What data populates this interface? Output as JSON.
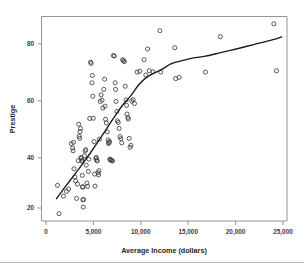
{
  "chart_data": {
    "type": "scatter",
    "title": "",
    "xlabel": "Average Income (dollars)",
    "ylabel": "Prestige",
    "xlim": [
      -1200,
      26800
    ],
    "ylim": [
      12,
      90
    ],
    "grid": false,
    "legend": null,
    "xticks": [
      0,
      5000,
      10000,
      15000,
      20000,
      25000
    ],
    "xtick_labels": [
      "0",
      "5,000",
      "10,000",
      "15,000",
      "20,000",
      "25,000"
    ],
    "yticks": [
      20,
      40,
      60,
      80
    ],
    "ytick_labels": [
      "20",
      "40",
      "60",
      "80"
    ],
    "marker": "open-circle",
    "marker_color": "#3c3c3c",
    "points": [
      [
        625,
        25.6
      ],
      [
        800,
        14.8
      ],
      [
        1300,
        21.5
      ],
      [
        1650,
        23.3
      ],
      [
        1890,
        24.2
      ],
      [
        2200,
        41.5
      ],
      [
        2350,
        39.8
      ],
      [
        2400,
        38.8
      ],
      [
        2450,
        42.0
      ],
      [
        2500,
        31.9
      ],
      [
        2600,
        28.8
      ],
      [
        2700,
        27.3
      ],
      [
        2800,
        20.6
      ],
      [
        2900,
        26.1
      ],
      [
        3000,
        35.0
      ],
      [
        3050,
        48.9
      ],
      [
        3100,
        44.3
      ],
      [
        3150,
        43.5
      ],
      [
        3200,
        46.1
      ],
      [
        3250,
        47.3
      ],
      [
        3300,
        36.2
      ],
      [
        3350,
        35.9
      ],
      [
        3400,
        34.8
      ],
      [
        3430,
        35.2
      ],
      [
        3450,
        29.4
      ],
      [
        3480,
        25.1
      ],
      [
        3500,
        24.9
      ],
      [
        3520,
        20.1
      ],
      [
        3560,
        17.3
      ],
      [
        3600,
        20.2
      ],
      [
        3700,
        36.9
      ],
      [
        3780,
        38.7
      ],
      [
        3850,
        39.2
      ],
      [
        3900,
        33.3
      ],
      [
        3980,
        26.5
      ],
      [
        4050,
        25.2
      ],
      [
        4150,
        30.9
      ],
      [
        4200,
        35.6
      ],
      [
        4300,
        51.1
      ],
      [
        4400,
        72.6
      ],
      [
        4460,
        72.1
      ],
      [
        4550,
        64.7
      ],
      [
        4600,
        67.5
      ],
      [
        4650,
        59.6
      ],
      [
        4700,
        51.2
      ],
      [
        4800,
        42.3
      ],
      [
        4850,
        29.9
      ],
      [
        4900,
        25.3
      ],
      [
        5000,
        35.9
      ],
      [
        5050,
        36.2
      ],
      [
        5100,
        35.2
      ],
      [
        5150,
        34.9
      ],
      [
        5250,
        30.4
      ],
      [
        5300,
        29.6
      ],
      [
        5350,
        31.2
      ],
      [
        5400,
        43.2
      ],
      [
        5500,
        57.6
      ],
      [
        5600,
        60.1
      ],
      [
        5700,
        58.1
      ],
      [
        5800,
        55.1
      ],
      [
        5900,
        62.2
      ],
      [
        6000,
        66.1
      ],
      [
        6050,
        55.8
      ],
      [
        6100,
        50.8
      ],
      [
        6200,
        49.4
      ],
      [
        6300,
        46.0
      ],
      [
        6400,
        42.9
      ],
      [
        6450,
        41.5
      ],
      [
        6500,
        41.9
      ],
      [
        6550,
        42.3
      ],
      [
        6600,
        35.6
      ],
      [
        6650,
        35.4
      ],
      [
        6700,
        35.2
      ],
      [
        6800,
        35.1
      ],
      [
        6900,
        34.9
      ],
      [
        7000,
        75.1
      ],
      [
        7100,
        74.9
      ],
      [
        7200,
        64.7
      ],
      [
        7250,
        62.2
      ],
      [
        7300,
        57.6
      ],
      [
        7400,
        53.8
      ],
      [
        7450,
        50.2
      ],
      [
        7550,
        49.6
      ],
      [
        7650,
        47.3
      ],
      [
        7750,
        44.2
      ],
      [
        7850,
        43.4
      ],
      [
        7950,
        41.8
      ],
      [
        8050,
        73.5
      ],
      [
        8150,
        73.1
      ],
      [
        8250,
        72.8
      ],
      [
        8350,
        63.4
      ],
      [
        8450,
        58.2
      ],
      [
        8500,
        56.1
      ],
      [
        8550,
        52.8
      ],
      [
        8650,
        51.5
      ],
      [
        8700,
        50.9
      ],
      [
        8800,
        43.5
      ],
      [
        8900,
        40.1
      ],
      [
        9000,
        40.9
      ],
      [
        9100,
        57.7
      ],
      [
        9250,
        58.3
      ],
      [
        9400,
        56.8
      ],
      [
        9700,
        68.8
      ],
      [
        10000,
        69.1
      ],
      [
        10500,
        73.5
      ],
      [
        10700,
        67.7
      ],
      [
        10900,
        77.6
      ],
      [
        11100,
        69.3
      ],
      [
        11500,
        68.9
      ],
      [
        12300,
        84.6
      ],
      [
        12400,
        68.8
      ],
      [
        14000,
        78.1
      ],
      [
        14100,
        66.3
      ],
      [
        14500,
        66.8
      ],
      [
        17500,
        68.8
      ],
      [
        19200,
        82.3
      ],
      [
        25300,
        87.2
      ],
      [
        25600,
        69.3
      ]
    ],
    "smoother": {
      "kind": "lowess",
      "path": [
        [
          500,
          20.5
        ],
        [
          1500,
          25.0
        ],
        [
          2500,
          29.4
        ],
        [
          3500,
          33.9
        ],
        [
          4500,
          38.6
        ],
        [
          5500,
          43.5
        ],
        [
          6500,
          48.6
        ],
        [
          7500,
          53.6
        ],
        [
          8200,
          56.8
        ],
        [
          9000,
          59.8
        ],
        [
          9800,
          63.6
        ],
        [
          10600,
          66.3
        ],
        [
          11500,
          68.2
        ],
        [
          12500,
          69.8
        ],
        [
          13500,
          71.8
        ],
        [
          14500,
          72.9
        ],
        [
          16000,
          74.1
        ],
        [
          17500,
          74.9
        ],
        [
          19000,
          76.0
        ],
        [
          21000,
          77.6
        ],
        [
          23000,
          79.3
        ],
        [
          25000,
          81.0
        ],
        [
          26200,
          82.2
        ]
      ]
    }
  }
}
